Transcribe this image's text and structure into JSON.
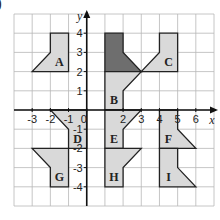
{
  "corner_mark": ")",
  "grid": {
    "x_range": [
      -4,
      7
    ],
    "y_range": [
      -5,
      5
    ],
    "x_axis_name": "x",
    "y_axis_name": "y",
    "x_tick_labels": [
      {
        "value": -3,
        "text": "-3"
      },
      {
        "value": -2,
        "text": "-2"
      },
      {
        "value": -1,
        "text": "-1"
      },
      {
        "value": 0,
        "text": "0"
      },
      {
        "value": 2,
        "text": "2"
      },
      {
        "value": 3,
        "text": "3"
      },
      {
        "value": 4,
        "text": "4"
      },
      {
        "value": 5,
        "text": "5"
      },
      {
        "value": 6,
        "text": "6"
      }
    ],
    "y_tick_labels": [
      {
        "value": 4,
        "text": "4"
      },
      {
        "value": 3,
        "text": "3"
      },
      {
        "value": 2,
        "text": "2"
      },
      {
        "value": 1,
        "text": "1"
      },
      {
        "value": -1,
        "text": "-1"
      },
      {
        "value": -2,
        "text": "-2"
      },
      {
        "value": -3,
        "text": "-3"
      },
      {
        "value": -4,
        "text": "-4"
      }
    ]
  },
  "colors": {
    "grid_line": "#b8b8b8",
    "axis": "#111111",
    "shape_fill": "#d9d9d9",
    "shape_fill_dark": "#6e6e6e",
    "shape_stroke": "#222222"
  },
  "shapes": [
    {
      "id": "object",
      "label": "",
      "dark": true,
      "points": [
        [
          1,
          4
        ],
        [
          2,
          4
        ],
        [
          2,
          3
        ],
        [
          3,
          2
        ],
        [
          1,
          2
        ]
      ],
      "label_at": null
    },
    {
      "id": "A",
      "label": "A",
      "dark": false,
      "points": [
        [
          -3,
          2
        ],
        [
          -1,
          2
        ],
        [
          -1,
          4
        ],
        [
          -2,
          4
        ],
        [
          -2,
          3
        ]
      ],
      "label_at": [
        -1.5,
        2.5
      ]
    },
    {
      "id": "C",
      "label": "C",
      "dark": false,
      "points": [
        [
          3,
          2
        ],
        [
          5,
          2
        ],
        [
          5,
          4
        ],
        [
          4,
          4
        ],
        [
          4,
          3
        ]
      ],
      "label_at": [
        4.5,
        2.5
      ]
    },
    {
      "id": "B",
      "label": "B",
      "dark": false,
      "points": [
        [
          1,
          2
        ],
        [
          3,
          2
        ],
        [
          2,
          1
        ],
        [
          2,
          0
        ],
        [
          1,
          0
        ]
      ],
      "label_at": [
        1.5,
        0.5
      ]
    },
    {
      "id": "D",
      "label": "D",
      "dark": false,
      "points": [
        [
          -2,
          0
        ],
        [
          0,
          0
        ],
        [
          0,
          -2
        ],
        [
          -1,
          -2
        ],
        [
          -1,
          -1
        ]
      ],
      "label_at": [
        -0.5,
        -1.5
      ]
    },
    {
      "id": "E",
      "label": "E",
      "dark": false,
      "points": [
        [
          1,
          0
        ],
        [
          3,
          0
        ],
        [
          2,
          -1
        ],
        [
          2,
          -2
        ],
        [
          1,
          -2
        ]
      ],
      "label_at": [
        1.5,
        -1.5
      ]
    },
    {
      "id": "F",
      "label": "F",
      "dark": false,
      "points": [
        [
          4,
          0
        ],
        [
          5,
          0
        ],
        [
          5,
          -1
        ],
        [
          6,
          -2
        ],
        [
          4,
          -2
        ]
      ],
      "label_at": [
        4.5,
        -1.5
      ]
    },
    {
      "id": "G",
      "label": "G",
      "dark": false,
      "points": [
        [
          -3,
          -2
        ],
        [
          -1,
          -2
        ],
        [
          -1,
          -4
        ],
        [
          -2,
          -4
        ],
        [
          -2,
          -3
        ]
      ],
      "label_at": [
        -1.5,
        -3.5
      ]
    },
    {
      "id": "H",
      "label": "H",
      "dark": false,
      "points": [
        [
          1,
          -2
        ],
        [
          3,
          -2
        ],
        [
          2,
          -3
        ],
        [
          2,
          -4
        ],
        [
          1,
          -4
        ]
      ],
      "label_at": [
        1.5,
        -3.5
      ]
    },
    {
      "id": "I",
      "label": "I",
      "dark": false,
      "points": [
        [
          4,
          -2
        ],
        [
          5,
          -2
        ],
        [
          5,
          -3
        ],
        [
          6,
          -4
        ],
        [
          4,
          -4
        ]
      ],
      "label_at": [
        4.5,
        -3.5
      ]
    }
  ]
}
